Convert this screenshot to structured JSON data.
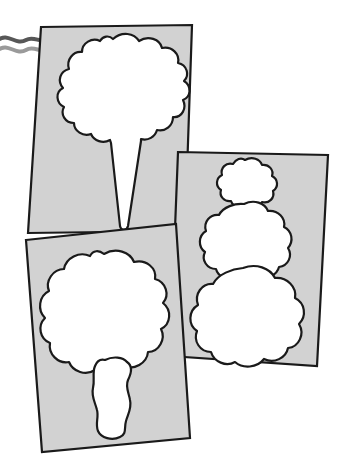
{
  "scene": {
    "title": "Three overlapping stencil cards with cut-out shapes",
    "type": "line-art illustration",
    "canvas": {
      "width": 345,
      "height": 469
    },
    "background_color": "#ffffff"
  },
  "style": {
    "card_fill": "#d2d2d2",
    "card_stroke": "#1a1a1a",
    "card_stroke_width": 2.2,
    "cutout_fill": "#ffffff",
    "cutout_stroke": "#1a1a1a",
    "cutout_stroke_width": 2.2,
    "squiggle_color_dark": "#575757",
    "squiggle_color_light": "#9a9a9a"
  },
  "decorations": {
    "squiggle": {
      "name": "wavy-line",
      "description": "Two parallel gray wavy lines entering from the left edge and ending at the first card",
      "start_x": 0,
      "end_x": 50,
      "y": 46,
      "stroke_width": 4
    }
  },
  "cards": [
    {
      "id": "card-cone",
      "label": "Ice cream cone stencil card",
      "z": 1,
      "rotation_deg": -6,
      "corners": [
        [
          41,
          27
        ],
        [
          192,
          25
        ],
        [
          185,
          231
        ],
        [
          28,
          233
        ]
      ],
      "polygon_points": "41,27 192,25 185,231 28,233",
      "cutout": {
        "name": "ice-cream-cone-cutout",
        "description": "Bumpy scalloped scoop tapering to a pointed cone",
        "path": "M 112 38 C 120 32 131 33 136 39 C 143 34 154 36 157 43 C 166 41 174 47 173 55 C 182 56 187 64 183 71 C 191 75 193 85 186 90 C 192 96 190 106 182 108 C 185 116 180 124 172 123 C 172 131 164 137 157 134 C 154 141 145 144 139 139 C 134 145 124 146 119 140 C 113 145 103 143 100 136 C 92 139 84 134 84 126 C 76 126 71 118 74 111 C 67 108 65 98 71 93 C 64 88 65 78 73 75 C 69 68 73 59 81 58 C 79 50 86 43 94 45 C 95 38 104 34 112 38 Z"
      }
    },
    {
      "id": "card-snowman",
      "label": "Snowman stencil card with three stacked blobs",
      "z": 2,
      "rotation_deg": 5,
      "corners": [
        [
          178,
          152
        ],
        [
          328,
          155
        ],
        [
          317,
          366
        ],
        [
          170,
          356
        ]
      ],
      "polygon_points": "178,152 328,155 317,366 170,356",
      "cutouts": [
        {
          "name": "snowman-head-cutout",
          "size": "small",
          "center": [
            247,
            182
          ],
          "radius": 22
        },
        {
          "name": "snowman-middle-cutout",
          "size": "medium",
          "center": [
            245,
            240
          ],
          "radius": 35
        },
        {
          "name": "snowman-base-cutout",
          "size": "large",
          "center": [
            243,
            312
          ],
          "radius": 45
        }
      ]
    },
    {
      "id": "card-tree",
      "label": "Tree stencil card with crown and trunk",
      "z": 3,
      "rotation_deg": 8,
      "corners": [
        [
          26,
          240
        ],
        [
          176,
          224
        ],
        [
          190,
          438
        ],
        [
          42,
          452
        ]
      ],
      "polygon_points": "26,240 176,224 190,438 42,452",
      "cutouts": [
        {
          "name": "tree-crown-cutout",
          "description": "Large bumpy scalloped crown",
          "center": [
            105,
            315
          ],
          "radius": 58
        },
        {
          "name": "tree-trunk-cutout",
          "description": "Narrow wavy vertical trunk",
          "center": [
            113,
            395
          ],
          "width": 38,
          "height": 78
        }
      ]
    }
  ]
}
